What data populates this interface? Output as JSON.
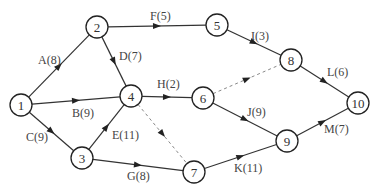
{
  "diagram": {
    "type": "activity-on-arrow network",
    "nodes": [
      {
        "id": "1",
        "x": 21,
        "y": 105
      },
      {
        "id": "2",
        "x": 97,
        "y": 27
      },
      {
        "id": "3",
        "x": 82,
        "y": 158
      },
      {
        "id": "4",
        "x": 131,
        "y": 96
      },
      {
        "id": "5",
        "x": 217,
        "y": 25
      },
      {
        "id": "6",
        "x": 203,
        "y": 98
      },
      {
        "id": "7",
        "x": 194,
        "y": 172
      },
      {
        "id": "8",
        "x": 291,
        "y": 60
      },
      {
        "id": "9",
        "x": 287,
        "y": 141
      },
      {
        "id": "10",
        "x": 358,
        "y": 103
      }
    ],
    "edges": [
      {
        "from": "1",
        "to": "2",
        "label": "A(8)",
        "lx": 38,
        "ly": 64,
        "dummy": false
      },
      {
        "from": "1",
        "to": "4",
        "label": "B(9)",
        "lx": 72,
        "ly": 117,
        "dummy": false
      },
      {
        "from": "1",
        "to": "3",
        "label": "C(9)",
        "lx": 26,
        "ly": 141,
        "dummy": false
      },
      {
        "from": "2",
        "to": "4",
        "label": "D(7)",
        "lx": 119,
        "ly": 60,
        "dummy": false
      },
      {
        "from": "3",
        "to": "4",
        "label": "E(11)",
        "lx": 112,
        "ly": 139,
        "dummy": false
      },
      {
        "from": "2",
        "to": "5",
        "label": "F(5)",
        "lx": 150,
        "ly": 20,
        "dummy": false
      },
      {
        "from": "3",
        "to": "7",
        "label": "G(8)",
        "lx": 127,
        "ly": 180,
        "dummy": false
      },
      {
        "from": "4",
        "to": "6",
        "label": "H(2)",
        "lx": 157,
        "ly": 88,
        "dummy": false
      },
      {
        "from": "5",
        "to": "8",
        "label": "I(3)",
        "lx": 251,
        "ly": 40,
        "dummy": false
      },
      {
        "from": "6",
        "to": "9",
        "label": "J(9)",
        "lx": 247,
        "ly": 116,
        "dummy": false
      },
      {
        "from": "7",
        "to": "9",
        "label": "K(11)",
        "lx": 234,
        "ly": 172,
        "dummy": false
      },
      {
        "from": "8",
        "to": "10",
        "label": "L(6)",
        "lx": 327,
        "ly": 76,
        "dummy": false
      },
      {
        "from": "9",
        "to": "10",
        "label": "M(7)",
        "lx": 324,
        "ly": 133,
        "dummy": false
      },
      {
        "from": "4",
        "to": "7",
        "label": "",
        "lx": 0,
        "ly": 0,
        "dummy": true
      },
      {
        "from": "6",
        "to": "8",
        "label": "",
        "lx": 0,
        "ly": 0,
        "dummy": true
      }
    ]
  }
}
